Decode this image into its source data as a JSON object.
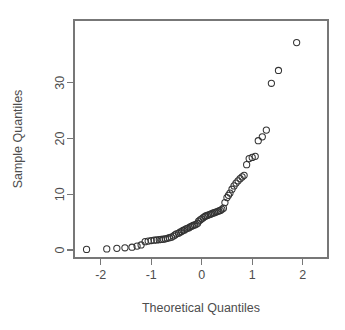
{
  "chart_data": {
    "type": "scatter",
    "title": "",
    "xlabel": "Theoretical Quantiles",
    "ylabel": "Sample Quantiles",
    "xlim": [
      -2.54,
      2.54
    ],
    "ylim": [
      -1.5,
      38.5
    ],
    "xticks": [
      -2,
      -1,
      0,
      1,
      2
    ],
    "xticklabels": [
      "-2",
      "-1",
      "0",
      "1",
      "2"
    ],
    "yticks": [
      0,
      10,
      20,
      30
    ],
    "yticklabels": [
      "0",
      "10",
      "20",
      "30"
    ],
    "grid": false,
    "legend": false,
    "marker": "open-circle",
    "marker_color": "#333333",
    "background": "#ffffff",
    "frame_color": "#777777",
    "n_points": 90,
    "series": [
      {
        "name": "Sample vs Theoretical Quantiles",
        "x": [
          -2.28,
          -1.88,
          -1.68,
          -1.52,
          -1.38,
          -1.28,
          -1.2,
          -1.12,
          -1.06,
          -1.0,
          -0.94,
          -0.89,
          -0.84,
          -0.8,
          -0.76,
          -0.72,
          -0.68,
          -0.64,
          -0.6,
          -0.56,
          -0.53,
          -0.5,
          -0.46,
          -0.43,
          -0.4,
          -0.37,
          -0.34,
          -0.31,
          -0.28,
          -0.25,
          -0.22,
          -0.19,
          -0.17,
          -0.14,
          -0.11,
          -0.08,
          -0.06,
          -0.03,
          0.0,
          0.03,
          0.06,
          0.08,
          0.11,
          0.14,
          0.17,
          0.19,
          0.22,
          0.25,
          0.28,
          0.31,
          0.34,
          0.37,
          0.4,
          0.43,
          0.46,
          0.5,
          0.53,
          0.56,
          0.6,
          0.64,
          0.68,
          0.72,
          0.76,
          0.8,
          0.84,
          0.89,
          0.94,
          1.0,
          1.06,
          1.12,
          1.2,
          1.28,
          1.38,
          1.52,
          1.68,
          1.88,
          2.28
        ],
        "y": [
          0.1,
          0.2,
          0.3,
          0.4,
          0.5,
          0.7,
          0.9,
          1.1,
          1.3,
          1.5,
          1.6,
          1.7,
          1.8,
          1.85,
          1.9,
          2.0,
          2.1,
          2.2,
          2.3,
          2.5,
          2.7,
          2.9,
          3.0,
          3.2,
          3.3,
          3.5,
          3.6,
          3.8,
          3.9,
          4.0,
          4.2,
          4.3,
          4.4,
          4.5,
          4.6,
          4.8,
          5.2,
          5.4,
          5.6,
          5.8,
          6.0,
          6.1,
          6.2,
          6.3,
          6.4,
          6.5,
          6.6,
          6.7,
          6.8,
          6.9,
          7.0,
          7.1,
          7.3,
          7.5,
          8.5,
          9.4,
          9.8,
          10.2,
          10.9,
          11.5,
          12.0,
          12.4,
          12.8,
          13.1,
          13.4,
          15.3,
          16.4,
          16.6,
          16.8,
          19.6,
          20.3,
          21.5,
          29.9,
          32.2,
          37.2,
          30.0,
          37.2
        ]
      }
    ],
    "points": [
      {
        "x": -2.28,
        "y": 0.1
      },
      {
        "x": -1.88,
        "y": 0.2
      },
      {
        "x": -1.68,
        "y": 0.3
      },
      {
        "x": -1.52,
        "y": 0.4
      },
      {
        "x": -1.38,
        "y": 0.5
      },
      {
        "x": -1.28,
        "y": 0.7
      },
      {
        "x": -1.2,
        "y": 0.9
      },
      {
        "x": -1.12,
        "y": 1.5
      },
      {
        "x": -1.06,
        "y": 1.6
      },
      {
        "x": -1.0,
        "y": 1.7
      },
      {
        "x": -0.94,
        "y": 1.75
      },
      {
        "x": -0.89,
        "y": 1.8
      },
      {
        "x": -0.84,
        "y": 1.85
      },
      {
        "x": -0.8,
        "y": 1.9
      },
      {
        "x": -0.76,
        "y": 1.95
      },
      {
        "x": -0.72,
        "y": 2.0
      },
      {
        "x": -0.68,
        "y": 2.1
      },
      {
        "x": -0.64,
        "y": 2.2
      },
      {
        "x": -0.6,
        "y": 2.3
      },
      {
        "x": -0.56,
        "y": 2.5
      },
      {
        "x": -0.53,
        "y": 2.7
      },
      {
        "x": -0.5,
        "y": 2.9
      },
      {
        "x": -0.46,
        "y": 3.0
      },
      {
        "x": -0.43,
        "y": 3.2
      },
      {
        "x": -0.4,
        "y": 3.3
      },
      {
        "x": -0.37,
        "y": 3.5
      },
      {
        "x": -0.34,
        "y": 3.6
      },
      {
        "x": -0.31,
        "y": 3.8
      },
      {
        "x": -0.28,
        "y": 3.9
      },
      {
        "x": -0.25,
        "y": 4.0
      },
      {
        "x": -0.22,
        "y": 4.2
      },
      {
        "x": -0.19,
        "y": 4.3
      },
      {
        "x": -0.17,
        "y": 4.4
      },
      {
        "x": -0.14,
        "y": 4.5
      },
      {
        "x": -0.11,
        "y": 4.6
      },
      {
        "x": -0.08,
        "y": 4.8
      },
      {
        "x": -0.06,
        "y": 5.2
      },
      {
        "x": -0.03,
        "y": 5.4
      },
      {
        "x": 0.0,
        "y": 5.6
      },
      {
        "x": 0.03,
        "y": 5.8
      },
      {
        "x": 0.06,
        "y": 6.0
      },
      {
        "x": 0.08,
        "y": 6.1
      },
      {
        "x": 0.11,
        "y": 6.2
      },
      {
        "x": 0.14,
        "y": 6.3
      },
      {
        "x": 0.17,
        "y": 6.4
      },
      {
        "x": 0.19,
        "y": 6.5
      },
      {
        "x": 0.22,
        "y": 6.6
      },
      {
        "x": 0.25,
        "y": 6.7
      },
      {
        "x": 0.28,
        "y": 6.8
      },
      {
        "x": 0.31,
        "y": 6.9
      },
      {
        "x": 0.34,
        "y": 7.0
      },
      {
        "x": 0.37,
        "y": 7.1
      },
      {
        "x": 0.4,
        "y": 7.3
      },
      {
        "x": 0.43,
        "y": 7.5
      },
      {
        "x": 0.46,
        "y": 8.5
      },
      {
        "x": 0.5,
        "y": 9.4
      },
      {
        "x": 0.53,
        "y": 9.8
      },
      {
        "x": 0.56,
        "y": 10.2
      },
      {
        "x": 0.6,
        "y": 10.9
      },
      {
        "x": 0.64,
        "y": 11.5
      },
      {
        "x": 0.68,
        "y": 12.0
      },
      {
        "x": 0.72,
        "y": 12.4
      },
      {
        "x": 0.76,
        "y": 12.8
      },
      {
        "x": 0.8,
        "y": 13.1
      },
      {
        "x": 0.84,
        "y": 13.4
      },
      {
        "x": 0.89,
        "y": 15.3
      },
      {
        "x": 0.94,
        "y": 16.4
      },
      {
        "x": 1.0,
        "y": 16.6
      },
      {
        "x": 1.06,
        "y": 16.8
      },
      {
        "x": 1.12,
        "y": 19.6
      },
      {
        "x": 1.2,
        "y": 20.3
      },
      {
        "x": 1.28,
        "y": 21.5
      },
      {
        "x": 1.38,
        "y": 29.9
      },
      {
        "x": 1.52,
        "y": 32.2
      },
      {
        "x": 1.88,
        "y": 37.2
      }
    ]
  },
  "plot": {
    "geometry": {
      "left": 74,
      "right": 328,
      "top": 20,
      "bottom": 258,
      "x_zero_px": 201.7,
      "x_unit_px": 50.5,
      "y_zero_px": 250,
      "y_unit_px": 5.576
    },
    "marker_radius": 3.1
  },
  "labels": {
    "x_axis_title": "Theoretical Quantiles",
    "y_axis_title": "Sample Quantiles",
    "x_tick_labels": [
      "-2",
      "-1",
      "0",
      "1",
      "2"
    ],
    "y_tick_labels": [
      "0",
      "10",
      "20",
      "30"
    ]
  }
}
